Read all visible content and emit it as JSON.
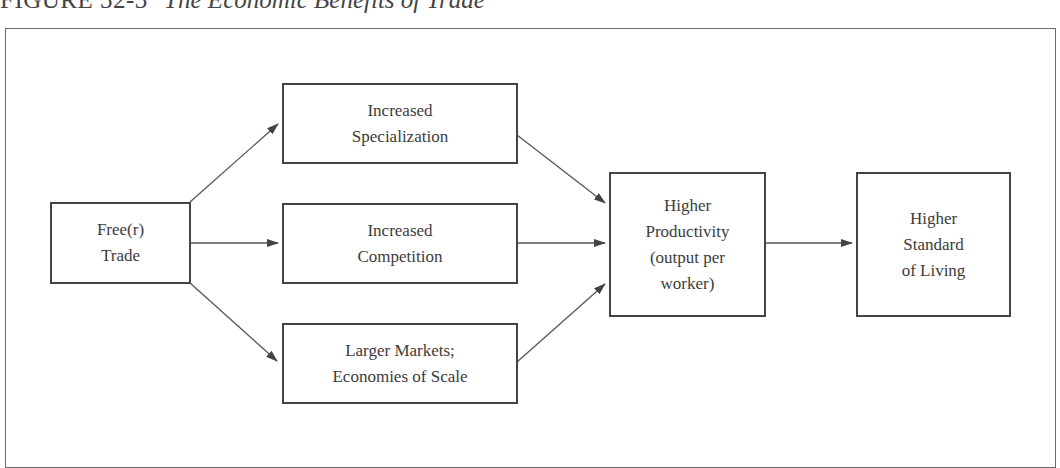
{
  "figure": {
    "number": "FIGURE 32-3",
    "title": "The Economic Benefits of Trade"
  },
  "nodes": {
    "free_trade": {
      "label": "Free(r)\nTrade"
    },
    "specialization": {
      "label": "Increased\nSpecialization"
    },
    "competition": {
      "label": "Increased\nCompetition"
    },
    "larger_markets": {
      "label": "Larger Markets;\nEconomies of Scale"
    },
    "productivity": {
      "label": "Higher\nProductivity\n(output per\nworker)"
    },
    "standard_of_living": {
      "label": "Higher\nStandard\nof Living"
    }
  },
  "edges": [
    {
      "from": "Free(r) Trade",
      "to": "Increased Specialization"
    },
    {
      "from": "Free(r) Trade",
      "to": "Increased Competition"
    },
    {
      "from": "Free(r) Trade",
      "to": "Larger Markets; Economies of Scale"
    },
    {
      "from": "Increased Specialization",
      "to": "Higher Productivity (output per worker)"
    },
    {
      "from": "Increased Competition",
      "to": "Higher Productivity (output per worker)"
    },
    {
      "from": "Larger Markets; Economies of Scale",
      "to": "Higher Productivity (output per worker)"
    },
    {
      "from": "Higher Productivity (output per worker)",
      "to": "Higher Standard of Living"
    }
  ],
  "colors": {
    "line": "#444444",
    "frame": "#6a6a6a",
    "text": "#3c3c3c"
  }
}
